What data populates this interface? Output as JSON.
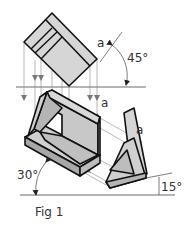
{
  "figure": {
    "caption": "Fig 1",
    "labels": {
      "a_top": "a",
      "a_middle": "a",
      "a_right": "a"
    },
    "angles": {
      "top": "45°",
      "left": "30°",
      "right": "15°"
    },
    "colors": {
      "outline": "#111111",
      "fill_light": "#d9d9d9",
      "fill_mid": "#c4c4c4",
      "fill_dark": "#9a9a9a",
      "projection_line": "#777777",
      "background": "#ffffff"
    }
  }
}
